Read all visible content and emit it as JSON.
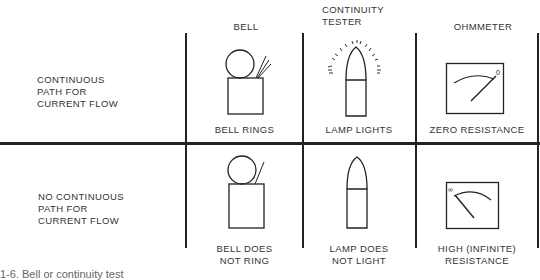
{
  "columns": [
    {
      "header": "BELL"
    },
    {
      "header": "CONTINUITY\nTESTER",
      "header_lines": [
        "CONTINUITY",
        "TESTER"
      ]
    },
    {
      "header": "OHMMETER"
    }
  ],
  "rows": [
    {
      "label_lines": [
        "CONTINUOUS",
        "PATH FOR",
        "CURRENT FLOW"
      ],
      "cells": [
        {
          "icon": "bell-ringing-icon",
          "caption_lines": [
            "BELL RINGS"
          ]
        },
        {
          "icon": "lamp-lit-icon",
          "caption_lines": [
            "LAMP LIGHTS"
          ]
        },
        {
          "icon": "ohmmeter-zero-icon",
          "caption_lines": [
            "ZERO RESISTANCE"
          ]
        }
      ]
    },
    {
      "label_lines": [
        "NO CONTINUOUS",
        "PATH FOR",
        "CURRENT FLOW"
      ],
      "cells": [
        {
          "icon": "bell-silent-icon",
          "caption_lines": [
            "BELL DOES",
            "NOT RING"
          ]
        },
        {
          "icon": "lamp-unlit-icon",
          "caption_lines": [
            "LAMP DOES",
            "NOT LIGHT"
          ]
        },
        {
          "icon": "ohmmeter-infinite-icon",
          "caption_lines": [
            "HIGH (INFINITE)",
            "RESISTANCE"
          ]
        }
      ]
    }
  ],
  "meter_symbols": {
    "zero": "0",
    "infinite": "∞"
  },
  "caption": "1-6. Bell or continuity test"
}
